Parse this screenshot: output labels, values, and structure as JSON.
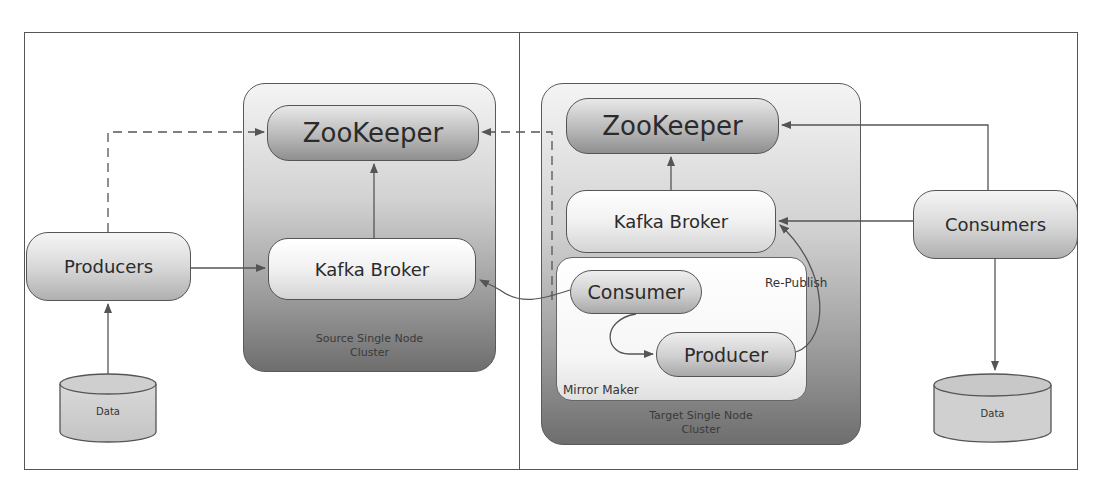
{
  "diagram": {
    "left_panel": {
      "producers": {
        "label": "Producers"
      },
      "data_store": {
        "label": "Data"
      },
      "source_cluster": {
        "label_line1": "Source Single Node",
        "label_line2": "Cluster",
        "zookeeper": {
          "label": "ZooKeeper"
        },
        "kafka_broker": {
          "label": "Kafka Broker"
        }
      }
    },
    "right_panel": {
      "consumers": {
        "label": "Consumers"
      },
      "data_store": {
        "label": "Data"
      },
      "target_cluster": {
        "label_line1": "Target Single Node",
        "label_line2": "Cluster",
        "zookeeper": {
          "label": "ZooKeeper"
        },
        "kafka_broker": {
          "label": "Kafka Broker"
        },
        "mirror_maker": {
          "label": "Mirror Maker",
          "consumer": {
            "label": "Consumer"
          },
          "producer": {
            "label": "Producer"
          },
          "republish_label": "Re-Publish"
        }
      }
    },
    "edges": [
      {
        "from": "Producers",
        "to": "Source ZooKeeper",
        "style": "dashed"
      },
      {
        "from": "Producers",
        "to": "Source Kafka Broker",
        "style": "solid"
      },
      {
        "from": "Data (left)",
        "to": "Producers",
        "style": "solid"
      },
      {
        "from": "Source Kafka Broker",
        "to": "Source ZooKeeper",
        "style": "solid"
      },
      {
        "from": "Mirror Maker Consumer",
        "to": "Source ZooKeeper",
        "style": "dashed"
      },
      {
        "from": "Mirror Maker Consumer",
        "to": "Source Kafka Broker",
        "style": "solid-curve"
      },
      {
        "from": "Mirror Maker Consumer",
        "to": "Mirror Maker Producer",
        "style": "solid-curve"
      },
      {
        "from": "Mirror Maker Producer",
        "to": "Target Kafka Broker",
        "style": "solid-curve",
        "label": "Re-Publish"
      },
      {
        "from": "Target Kafka Broker",
        "to": "Target ZooKeeper",
        "style": "solid"
      },
      {
        "from": "Consumers",
        "to": "Target ZooKeeper",
        "style": "solid"
      },
      {
        "from": "Consumers",
        "to": "Target Kafka Broker",
        "style": "solid"
      },
      {
        "from": "Consumers",
        "to": "Data (right)",
        "style": "solid"
      }
    ]
  },
  "colors": {
    "line": "#555555",
    "cluster_dark": "#6e6e6e",
    "cluster_light": "#f4f4f4",
    "text": "#2b2b2b"
  }
}
